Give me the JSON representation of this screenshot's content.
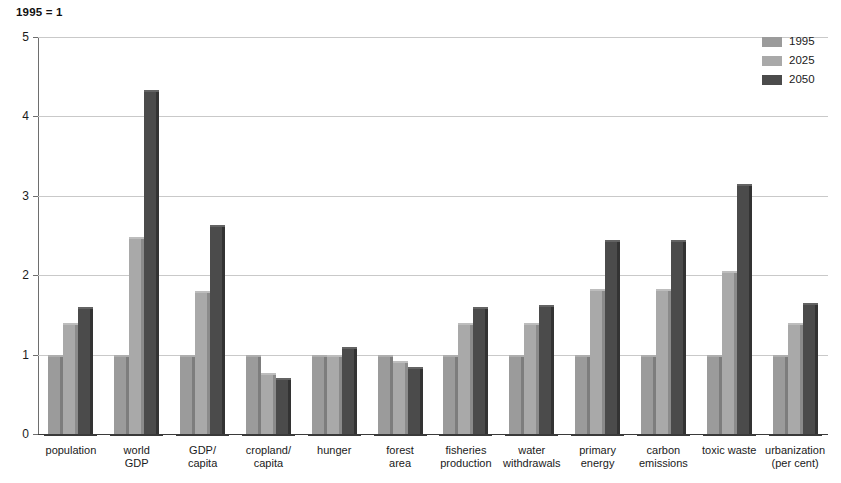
{
  "chart_data": {
    "type": "bar",
    "title": "1995 = 1",
    "xlabel": "",
    "ylabel": "",
    "ylim": [
      0,
      5
    ],
    "yticks": [
      0,
      1,
      2,
      3,
      4,
      5
    ],
    "grid": true,
    "legend_position": "top-right",
    "categories": [
      "population",
      "world\nGDP",
      "GDP/\ncapita",
      "cropland/\ncapita",
      "hunger",
      "forest\narea",
      "fisheries\nproduction",
      "water\nwithdrawals",
      "primary\nenergy",
      "carbon\nemissions",
      "toxic waste",
      "urbanization\n(per cent)"
    ],
    "series": [
      {
        "name": "1995",
        "color": "#9b9b9b",
        "values": [
          1.0,
          1.0,
          1.0,
          1.0,
          1.0,
          1.0,
          1.0,
          1.0,
          1.0,
          1.0,
          1.0,
          1.0
        ]
      },
      {
        "name": "2025",
        "color": "#a9a9a9",
        "values": [
          1.4,
          2.48,
          1.8,
          0.77,
          1.0,
          0.92,
          1.4,
          1.4,
          1.83,
          1.83,
          2.05,
          1.4
        ]
      },
      {
        "name": "2050",
        "color": "#4b4b4b",
        "values": [
          1.6,
          4.33,
          2.63,
          0.7,
          1.1,
          0.84,
          1.6,
          1.62,
          2.44,
          2.44,
          3.15,
          1.65
        ]
      }
    ]
  },
  "legend": {
    "items": [
      {
        "label": "1995",
        "color": "#9b9b9b"
      },
      {
        "label": "2025",
        "color": "#a9a9a9"
      },
      {
        "label": "2050",
        "color": "#4b4b4b"
      }
    ]
  }
}
